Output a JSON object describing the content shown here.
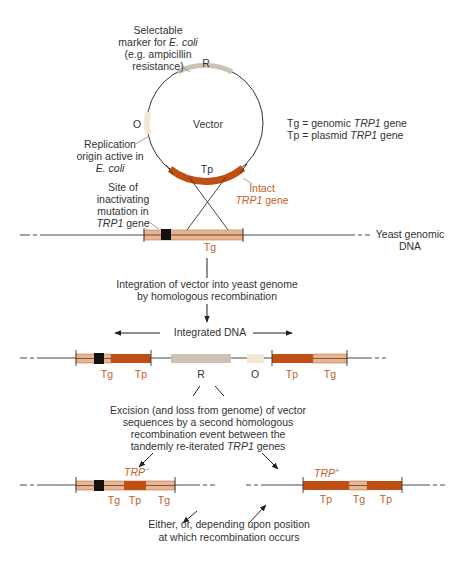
{
  "colors": {
    "plasmid_gene": "#c04f14",
    "genomic_gene": "#e9b48e",
    "genomic_gene_line": "#b57a52",
    "marker_R": "#cbc2b4",
    "origin_O": "#f4e6d4",
    "mutation": "#111111",
    "line": "#333333",
    "orange_text": "#c0622a"
  },
  "vector": {
    "marker_label_lines": [
      "Selectable",
      "marker for E. coli",
      "(e.g. ampicillin",
      "resistance)"
    ],
    "marker_line1": "Selectable",
    "marker_line2_pre": "marker for ",
    "marker_line2_it": "E. coli",
    "marker_line3": "(e.g. ampicillin",
    "marker_line4": "resistance)",
    "R": "R",
    "O": "O",
    "vector_label": "Vector",
    "Tp": "Tp",
    "origin_line1": "Replication",
    "origin_line2": "origin active in",
    "origin_line3": "E. coli",
    "intact_line1": "Intact",
    "intact_line2_it": "TRP1",
    "intact_line2_post": " gene"
  },
  "legend": {
    "tg_pre": "Tg = genomic ",
    "tg_it": "TRP1",
    "tg_post": " gene",
    "tp_pre": "Tp = plasmid ",
    "tp_it": "TRP1",
    "tp_post": " gene"
  },
  "genome": {
    "site_line1": "Site of",
    "site_line2": "inactivating",
    "site_line3": "mutation in",
    "site_line4_it": "TRP1",
    "site_line4_post": " gene",
    "Tg": "Tg",
    "yeast_line1": "Yeast genomic",
    "yeast_line2": "DNA"
  },
  "step1": {
    "line1": "Integration of vector into yeast genome",
    "line2": "by homologous recombination",
    "integrated_label": "Integrated DNA"
  },
  "integrated": {
    "labels": [
      "Tg",
      "Tp",
      "R",
      "O",
      "Tp",
      "Tg"
    ]
  },
  "step2": {
    "line1": "Excision (and loss from genome) of vector",
    "line2": "sequences by a second homologous",
    "line3": "recombination event between the",
    "line4_pre": "tandemly re-iterated ",
    "line4_it": "TRP1",
    "line4_post": " genes"
  },
  "result_minus": {
    "label": "TRP",
    "sup": "−",
    "genes": [
      "Tg",
      "Tp",
      "Tg"
    ]
  },
  "result_plus": {
    "label": "TRP",
    "sup": "+",
    "genes": [
      "Tp",
      "Tg",
      "Tp"
    ]
  },
  "footer": {
    "line1": "Either, or, depending upon position",
    "line2": "at which recombination occurs"
  }
}
